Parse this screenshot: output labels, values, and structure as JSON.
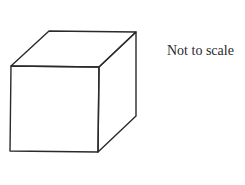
{
  "diagram": {
    "type": "cube-oblique-drawing",
    "annotation": "Not to scale",
    "stroke_color": "#2a2a2a",
    "vertices": {
      "front_top_left": [
        11,
        66
      ],
      "front_top_right": [
        99,
        67
      ],
      "front_bottom_left": [
        10,
        151
      ],
      "front_bottom_right": [
        98,
        152
      ],
      "back_top_left": [
        49,
        31
      ],
      "back_top_right": [
        136,
        32
      ],
      "back_bottom_right": [
        136,
        116
      ]
    }
  }
}
